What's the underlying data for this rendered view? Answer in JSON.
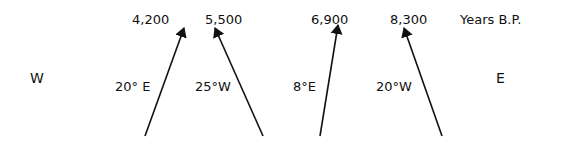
{
  "header": {
    "units": "Years B.P."
  },
  "directions": {
    "west": "W",
    "east": "E"
  },
  "arrows": [
    {
      "age": "4,200",
      "declination": "20° E"
    },
    {
      "age": "5,500",
      "declination": "25°W"
    },
    {
      "age": "6,900",
      "declination": "8°E"
    },
    {
      "age": "8,300",
      "declination": "20°W"
    }
  ]
}
